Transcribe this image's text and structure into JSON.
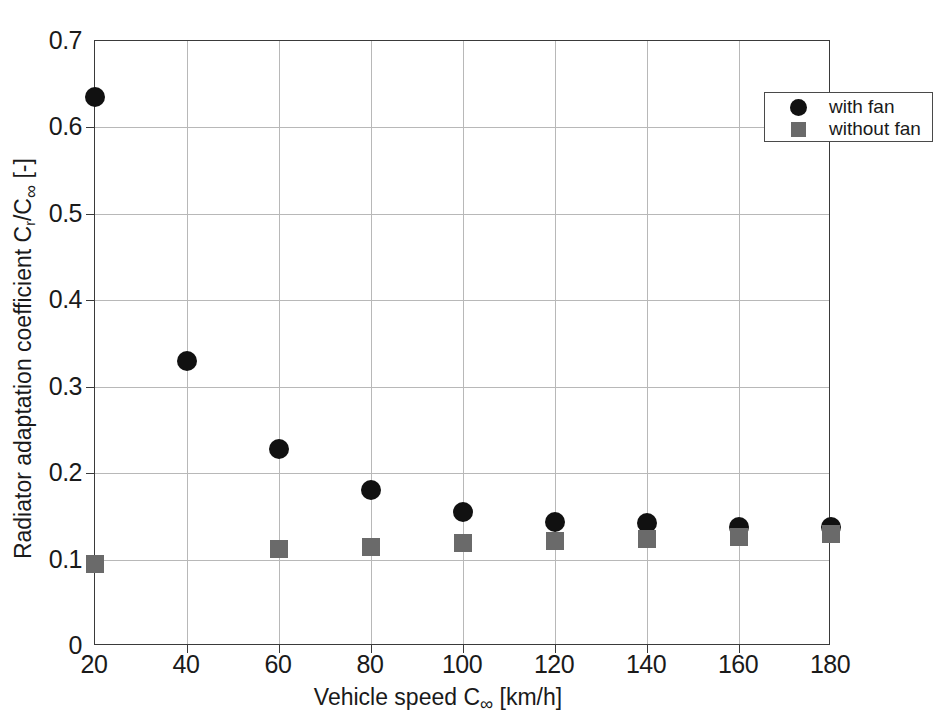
{
  "chart_data": {
    "type": "scatter",
    "title": "",
    "xlabel": "Vehicle speed C∞ [km/h]",
    "ylabel": "Radiator adaptation coefficient Cr/C∞ [-]",
    "xlim": [
      20,
      180
    ],
    "ylim": [
      0,
      0.7
    ],
    "xticks": [
      20,
      40,
      60,
      80,
      100,
      120,
      140,
      160,
      180
    ],
    "yticks": [
      0,
      0.1,
      0.2,
      0.3,
      0.4,
      0.5,
      0.6,
      0.7
    ],
    "xtick_labels": [
      "20",
      "40",
      "60",
      "80",
      "100",
      "120",
      "140",
      "160",
      "180"
    ],
    "ytick_labels": [
      "0",
      "0.1",
      "0.2",
      "0.3",
      "0.4",
      "0.5",
      "0.6",
      "0.7"
    ],
    "grid": true,
    "legend_position": "upper right",
    "series": [
      {
        "name": "with fan",
        "marker": "circle",
        "color": "#111111",
        "x": [
          20,
          40,
          60,
          80,
          100,
          120,
          140,
          160,
          180
        ],
        "y": [
          0.635,
          0.33,
          0.228,
          0.181,
          0.155,
          0.144,
          0.142,
          0.138,
          0.138
        ]
      },
      {
        "name": "without fan",
        "marker": "square",
        "color": "#6a6a6a",
        "x": [
          20,
          60,
          80,
          100,
          120,
          140,
          160,
          180
        ],
        "y": [
          0.095,
          0.112,
          0.115,
          0.119,
          0.121,
          0.124,
          0.126,
          0.13
        ]
      }
    ]
  },
  "axes": {
    "x_title_prefix": "Vehicle speed C",
    "x_title_sub": "∞",
    "x_title_suffix": " [km/h]",
    "y_title_prefix": "Radiator adaptation coefficient C",
    "y_title_sub1": "r",
    "y_title_mid": "/C",
    "y_title_sub2": "∞",
    "y_title_suffix": " [-]"
  },
  "legend": {
    "entries": [
      {
        "label": "with fan",
        "marker": "circle"
      },
      {
        "label": "without fan",
        "marker": "square"
      }
    ]
  }
}
